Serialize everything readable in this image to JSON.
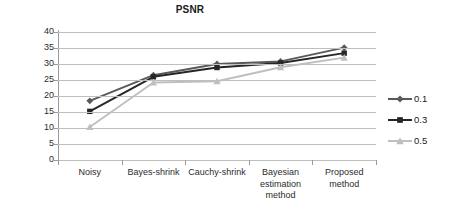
{
  "chart_data": {
    "type": "line",
    "title": "PSNR",
    "xlabel": "",
    "ylabel": "",
    "ylim": [
      0,
      40
    ],
    "ytick_step": 5,
    "yticks": [
      0,
      5,
      10,
      15,
      20,
      25,
      30,
      35,
      40
    ],
    "grid": true,
    "legend_position": "right",
    "categories": [
      "Noisy",
      "Bayes-shrink",
      "Cauchy-shrink",
      "Bayesian estimation method",
      "Proposed method"
    ],
    "series": [
      {
        "name": "0.1",
        "marker": "diamond",
        "color": "#595959",
        "values": [
          18.5,
          26.5,
          30.0,
          30.8,
          35.1
        ]
      },
      {
        "name": "0.3",
        "marker": "square",
        "color": "#262626",
        "values": [
          15.2,
          26.0,
          28.9,
          30.3,
          33.4
        ]
      },
      {
        "name": "0.5",
        "marker": "triangle",
        "color": "#bfbfbf",
        "values": [
          10.3,
          24.2,
          24.6,
          29.0,
          32.0
        ]
      }
    ]
  },
  "axis": {
    "ytick_labels": [
      "40",
      "35",
      "30",
      "25",
      "20",
      "15",
      "10",
      "5",
      "0"
    ]
  },
  "legend": {
    "entries": [
      {
        "label": "0.1"
      },
      {
        "label": "0.3"
      },
      {
        "label": "0.5"
      }
    ]
  },
  "colors": {
    "gridline": "#bfbfbf",
    "axis": "#9a9a9a",
    "text": "#231f20",
    "background": "#ffffff"
  }
}
